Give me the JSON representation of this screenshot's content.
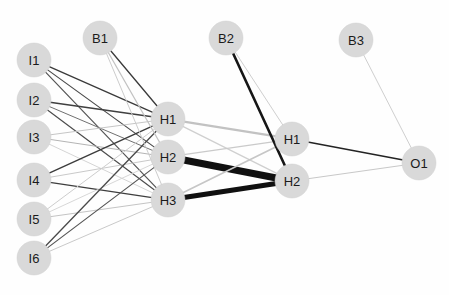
{
  "figure": {
    "background_color": "#fefefe",
    "width": 449,
    "height": 295,
    "node_fill": "#d9d9d9",
    "node_text_color": "#1b1b1b",
    "node_radius": 17,
    "caption": ""
  },
  "nodes": [
    {
      "id": "I1",
      "label": "I1",
      "x": 34,
      "y": 60,
      "layer": "input",
      "r": 17
    },
    {
      "id": "I2",
      "label": "I2",
      "x": 34,
      "y": 100,
      "layer": "input",
      "r": 17
    },
    {
      "id": "I3",
      "label": "I3",
      "x": 34,
      "y": 137,
      "layer": "input",
      "r": 17
    },
    {
      "id": "I4",
      "label": "I4",
      "x": 34,
      "y": 180,
      "layer": "input",
      "r": 17
    },
    {
      "id": "I5",
      "label": "I5",
      "x": 34,
      "y": 219,
      "layer": "input",
      "r": 17
    },
    {
      "id": "I6",
      "label": "I6",
      "x": 34,
      "y": 258,
      "layer": "input",
      "r": 17
    },
    {
      "id": "B1",
      "label": "B1",
      "x": 100,
      "y": 38,
      "layer": "bias1",
      "r": 17
    },
    {
      "id": "HA1",
      "label": "H1",
      "x": 168,
      "y": 119,
      "layer": "hidden1",
      "r": 17
    },
    {
      "id": "HA2",
      "label": "H2",
      "x": 168,
      "y": 157,
      "layer": "hidden1",
      "r": 17
    },
    {
      "id": "HA3",
      "label": "H3",
      "x": 168,
      "y": 200,
      "layer": "hidden1",
      "r": 17
    },
    {
      "id": "B2",
      "label": "B2",
      "x": 226,
      "y": 38,
      "layer": "bias2",
      "r": 17
    },
    {
      "id": "HB1",
      "label": "H1",
      "x": 292,
      "y": 139,
      "layer": "hidden2",
      "r": 17
    },
    {
      "id": "HB2",
      "label": "H2",
      "x": 292,
      "y": 181,
      "layer": "hidden2",
      "r": 17
    },
    {
      "id": "B3",
      "label": "B3",
      "x": 356,
      "y": 40,
      "layer": "bias3",
      "r": 17
    },
    {
      "id": "O1",
      "label": "O1",
      "x": 419,
      "y": 163,
      "layer": "output",
      "r": 17
    }
  ],
  "edges": [
    {
      "from": "I1",
      "to": "HA1",
      "color": "#3a3a3a",
      "width": 1.3
    },
    {
      "from": "I1",
      "to": "HA2",
      "color": "#4a4a4a",
      "width": 1.2
    },
    {
      "from": "I1",
      "to": "HA3",
      "color": "#555555",
      "width": 1.2
    },
    {
      "from": "I2",
      "to": "HA1",
      "color": "#3f3f3f",
      "width": 1.3
    },
    {
      "from": "I2",
      "to": "HA2",
      "color": "#707070",
      "width": 1.0
    },
    {
      "from": "I2",
      "to": "HA3",
      "color": "#4d4d4d",
      "width": 1.2
    },
    {
      "from": "I3",
      "to": "HA1",
      "color": "#c6c6c6",
      "width": 1.0
    },
    {
      "from": "I3",
      "to": "HA2",
      "color": "#b4b4b4",
      "width": 1.0
    },
    {
      "from": "I3",
      "to": "HA3",
      "color": "#cfcfcf",
      "width": 0.9
    },
    {
      "from": "I4",
      "to": "HA1",
      "color": "#3c3c3c",
      "width": 1.4
    },
    {
      "from": "I4",
      "to": "HA2",
      "color": "#c9c9c9",
      "width": 1.0
    },
    {
      "from": "I4",
      "to": "HA3",
      "color": "#3e3e3e",
      "width": 1.3
    },
    {
      "from": "I5",
      "to": "HA1",
      "color": "#cdcdcd",
      "width": 1.0
    },
    {
      "from": "I5",
      "to": "HA2",
      "color": "#d2d2d2",
      "width": 0.9
    },
    {
      "from": "I5",
      "to": "HA3",
      "color": "#c4c4c4",
      "width": 1.0
    },
    {
      "from": "I6",
      "to": "HA1",
      "color": "#4a4a4a",
      "width": 1.3
    },
    {
      "from": "I6",
      "to": "HA2",
      "color": "#555555",
      "width": 1.2
    },
    {
      "from": "I6",
      "to": "HA3",
      "color": "#c9c9c9",
      "width": 1.0
    },
    {
      "from": "B1",
      "to": "HA1",
      "color": "#3a3a3a",
      "width": 1.3
    },
    {
      "from": "B1",
      "to": "HA2",
      "color": "#c2c2c2",
      "width": 1.1
    },
    {
      "from": "B1",
      "to": "HA3",
      "color": "#cccccc",
      "width": 1.0
    },
    {
      "from": "HA1",
      "to": "HB1",
      "color": "#c2c2c2",
      "width": 2.2
    },
    {
      "from": "HA1",
      "to": "HB2",
      "color": "#cfcfcf",
      "width": 1.2
    },
    {
      "from": "HA2",
      "to": "HB1",
      "color": "#cacaca",
      "width": 1.2
    },
    {
      "from": "HA2",
      "to": "HB2",
      "color": "#101010",
      "width": 7.0
    },
    {
      "from": "HA3",
      "to": "HB1",
      "color": "#c6c6c6",
      "width": 1.6
    },
    {
      "from": "HA3",
      "to": "HB2",
      "color": "#101010",
      "width": 5.0
    },
    {
      "from": "B2",
      "to": "HB1",
      "color": "#cfcfcf",
      "width": 1.0
    },
    {
      "from": "B2",
      "to": "HB2",
      "color": "#161616",
      "width": 2.6
    },
    {
      "from": "HB1",
      "to": "O1",
      "color": "#232323",
      "width": 1.5
    },
    {
      "from": "HB2",
      "to": "O1",
      "color": "#c8c8c8",
      "width": 1.0
    },
    {
      "from": "B3",
      "to": "O1",
      "color": "#cfcfcf",
      "width": 1.0
    }
  ]
}
